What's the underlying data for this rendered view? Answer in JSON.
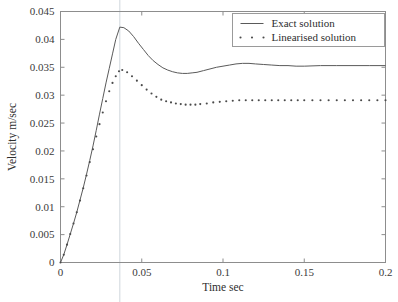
{
  "chart_data": {
    "type": "line",
    "title": "",
    "xlabel": "Time sec",
    "ylabel": "Velocity m/sec",
    "xlim": [
      0,
      0.2
    ],
    "ylim": [
      0,
      0.045
    ],
    "grid": false,
    "legend_position": "top-right",
    "xticks": [
      0,
      0.05,
      0.1,
      0.15,
      0.2
    ],
    "xtick_labels": [
      "0",
      "0.05",
      "0.1",
      "0.15",
      "0.2"
    ],
    "yticks": [
      0,
      0.005,
      0.01,
      0.015,
      0.02,
      0.025,
      0.03,
      0.035,
      0.04,
      0.045
    ],
    "ytick_labels": [
      "0",
      "0.005",
      "0.01",
      "0.015",
      "0.02",
      "0.025",
      "0.03",
      "0.035",
      "0.04",
      "0.045"
    ],
    "annotations": [
      {
        "name": "peak-guide-line",
        "type": "vline",
        "x": 0.0365
      }
    ],
    "series": [
      {
        "name": "Exact solution",
        "style": "solid",
        "color": "#5a5a5a",
        "x": [
          0,
          0.002,
          0.004,
          0.006,
          0.008,
          0.01,
          0.012,
          0.014,
          0.016,
          0.018,
          0.02,
          0.022,
          0.024,
          0.026,
          0.028,
          0.03,
          0.032,
          0.034,
          0.0365,
          0.039,
          0.042,
          0.045,
          0.048,
          0.051,
          0.054,
          0.057,
          0.06,
          0.063,
          0.066,
          0.069,
          0.072,
          0.075,
          0.078,
          0.081,
          0.084,
          0.088,
          0.092,
          0.096,
          0.1,
          0.104,
          0.108,
          0.112,
          0.116,
          0.12,
          0.125,
          0.13,
          0.135,
          0.14,
          0.145,
          0.15,
          0.16,
          0.17,
          0.18,
          0.19,
          0.2
        ],
        "y": [
          0,
          0.0014,
          0.0032,
          0.0051,
          0.007,
          0.009,
          0.0112,
          0.0134,
          0.0158,
          0.0183,
          0.0209,
          0.0237,
          0.0266,
          0.0294,
          0.0322,
          0.0348,
          0.0374,
          0.04,
          0.0422,
          0.0421,
          0.0415,
          0.0405,
          0.0393,
          0.0382,
          0.0371,
          0.0362,
          0.0355,
          0.0349,
          0.0345,
          0.0342,
          0.034,
          0.0339,
          0.0339,
          0.034,
          0.0341,
          0.0344,
          0.0347,
          0.035,
          0.0352,
          0.0354,
          0.0356,
          0.0357,
          0.0357,
          0.0356,
          0.0355,
          0.0354,
          0.0353,
          0.0353,
          0.0352,
          0.0352,
          0.0353,
          0.0353,
          0.0353,
          0.0353,
          0.0353
        ]
      },
      {
        "name": "Linearised solution",
        "style": "dotted",
        "color": "#4a4a4a",
        "x": [
          0,
          0.002,
          0.004,
          0.006,
          0.008,
          0.01,
          0.012,
          0.014,
          0.016,
          0.018,
          0.02,
          0.022,
          0.024,
          0.026,
          0.028,
          0.03,
          0.032,
          0.034,
          0.036,
          0.038,
          0.041,
          0.044,
          0.047,
          0.05,
          0.053,
          0.056,
          0.059,
          0.062,
          0.065,
          0.068,
          0.071,
          0.074,
          0.077,
          0.08,
          0.083,
          0.086,
          0.09,
          0.094,
          0.098,
          0.102,
          0.106,
          0.11,
          0.114,
          0.118,
          0.122,
          0.126,
          0.13,
          0.134,
          0.138,
          0.142,
          0.146,
          0.15,
          0.155,
          0.16,
          0.165,
          0.17,
          0.175,
          0.18,
          0.185,
          0.19,
          0.195,
          0.2
        ],
        "y": [
          0,
          0.0014,
          0.0032,
          0.0051,
          0.007,
          0.009,
          0.0111,
          0.0133,
          0.0156,
          0.018,
          0.0203,
          0.0226,
          0.0248,
          0.0269,
          0.0289,
          0.0307,
          0.0322,
          0.0334,
          0.0343,
          0.0345,
          0.0341,
          0.0334,
          0.0326,
          0.0318,
          0.031,
          0.0303,
          0.0297,
          0.0292,
          0.0289,
          0.0287,
          0.0285,
          0.0284,
          0.0283,
          0.0283,
          0.0283,
          0.0284,
          0.0285,
          0.0287,
          0.0288,
          0.0289,
          0.029,
          0.0291,
          0.0291,
          0.0291,
          0.0291,
          0.0291,
          0.0291,
          0.0291,
          0.0291,
          0.0291,
          0.0291,
          0.0291,
          0.0291,
          0.0291,
          0.0291,
          0.0291,
          0.0291,
          0.0291,
          0.0291,
          0.0291,
          0.0291,
          0.0291
        ]
      }
    ],
    "legend_entries": [
      {
        "label": "Exact solution",
        "style": "solid"
      },
      {
        "label": "Linearised solution",
        "style": "dotted"
      }
    ]
  }
}
